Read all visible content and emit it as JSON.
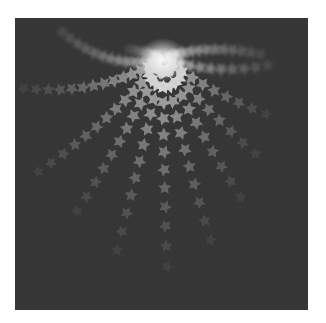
{
  "image": {
    "description": "Grayscale generative art: five-pointed star particles radiating in curved arms from a bright glowing center near the top of a dark square",
    "background_color": "#363636",
    "page_color": "#ffffff",
    "frame": {
      "x": 15,
      "y": 18,
      "width": 293,
      "height": 292
    }
  },
  "art": {
    "center": {
      "x": 148,
      "y": 40
    },
    "glow_color": "#f2f2f2",
    "star_color_near": "#b4b4b4",
    "star_color_far": "#4a4a4a",
    "star_radius": 7.5,
    "arms": [
      {
        "angle": 200,
        "curve": -0.9,
        "count": 13,
        "spacing": 9,
        "blur": true
      },
      {
        "angle": 215,
        "curve": -0.55,
        "count": 14,
        "spacing": 11
      },
      {
        "angle": 232,
        "curve": -0.25,
        "count": 13,
        "spacing": 14
      },
      {
        "angle": 245,
        "curve": -0.12,
        "count": 12,
        "spacing": 16
      },
      {
        "angle": 258,
        "curve": -0.04,
        "count": 12,
        "spacing": 18
      },
      {
        "angle": 270,
        "curve": 0.03,
        "count": 12,
        "spacing": 19
      },
      {
        "angle": 282,
        "curve": 0.08,
        "count": 11,
        "spacing": 19
      },
      {
        "angle": 295,
        "curve": 0.14,
        "count": 10,
        "spacing": 18
      },
      {
        "angle": 308,
        "curve": 0.22,
        "count": 9,
        "spacing": 17
      },
      {
        "angle": 322,
        "curve": 0.35,
        "count": 9,
        "spacing": 15
      },
      {
        "angle": 338,
        "curve": 0.6,
        "count": 10,
        "spacing": 12,
        "blur": true
      },
      {
        "angle": 160,
        "curve": 0.3,
        "count": 6,
        "spacing": 7,
        "blur": true
      },
      {
        "angle": 20,
        "curve": -0.5,
        "count": 12,
        "spacing": 9,
        "blur": true
      }
    ]
  }
}
